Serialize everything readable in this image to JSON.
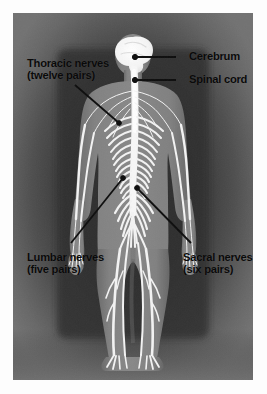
{
  "figure": {
    "view": "posterior full body",
    "style": "grayscale photographic illustration with vignette",
    "colors": {
      "plate_background_outer": "#6f6f6f",
      "plate_vignette_dark": "#3a3a3a",
      "body_silhouette": "#7d7d7d",
      "nerve_white": "#f2f2f2",
      "cerebrum_white": "#fafafa",
      "label_text": "#0a0a0a",
      "leader_line": "#111111",
      "paper_margin": "#fdfdfd"
    }
  },
  "labels": {
    "cerebrum": {
      "line1": "Cerebrum",
      "line2": ""
    },
    "spinal_cord": {
      "line1": "Spinal cord",
      "line2": ""
    },
    "thoracic": {
      "line1": "Thoracic nerves",
      "line2": "(twelve pairs)"
    },
    "lumbar": {
      "line1": "Lumbar nerves",
      "line2": "(five pairs)"
    },
    "sacral": {
      "line1": "Sacral nerves",
      "line2": "(six pairs)"
    }
  },
  "annotations": [
    {
      "name": "cerebrum",
      "text": "Cerebrum",
      "count": ""
    },
    {
      "name": "spinal-cord",
      "text": "Spinal cord",
      "count": ""
    },
    {
      "name": "thoracic",
      "text": "Thoracic nerves",
      "count": "twelve pairs"
    },
    {
      "name": "lumbar",
      "text": "Lumbar nerves",
      "count": "five pairs"
    },
    {
      "name": "sacral",
      "text": "Sacral nerves",
      "count": "six pairs"
    }
  ]
}
